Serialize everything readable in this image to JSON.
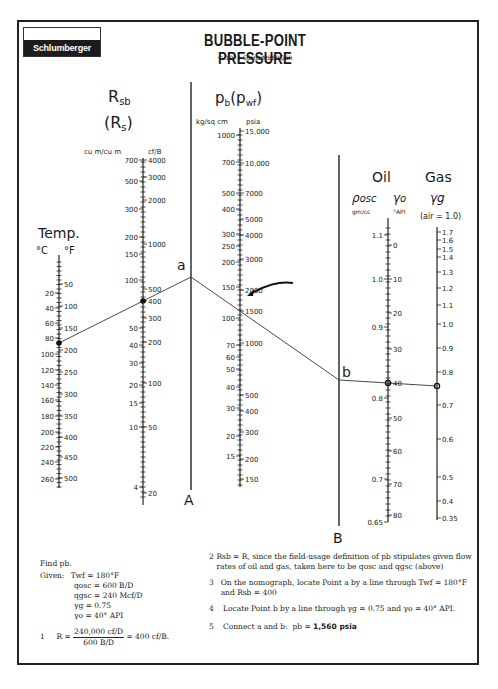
{
  "header": {
    "logo_text": "Schlumberger",
    "title": "BUBBLE-POINT PRESSURE",
    "copyright": "© 1974 SCHLUMBERGER"
  },
  "scales": {
    "temp": {
      "title": "Temp.",
      "unit_left": "°C",
      "unit_right": "°F",
      "left_ticks": [
        "20",
        "40",
        "60",
        "80",
        "100",
        "120",
        "140",
        "160",
        "180",
        "200",
        "220",
        "240",
        "260"
      ],
      "right_ticks": [
        "50",
        "100",
        "150",
        "200",
        "250",
        "300",
        "350",
        "400",
        "450",
        "500"
      ]
    },
    "rsb": {
      "title": "Rsb",
      "subtitle": "(Rs)",
      "unit_left": "cu m/cu m",
      "unit_right": "cf/B",
      "left_ticks": [
        "700",
        "500",
        "300",
        "200",
        "150",
        "100",
        "50",
        "40",
        "30",
        "20",
        "15",
        "10",
        "4"
      ],
      "right_ticks": [
        "4000",
        "3000",
        "2000",
        "1000",
        "500",
        "400",
        "300",
        "200",
        "100",
        "50",
        "20"
      ]
    },
    "pb": {
      "title": "pb(pwf)",
      "unit_left": "kg/sq cm",
      "unit_right": "psia",
      "left_ticks": [
        "1000",
        "700",
        "500",
        "400",
        "300",
        "250",
        "200",
        "150",
        "100",
        "70",
        "60",
        "50",
        "40",
        "30",
        "20",
        "15"
      ],
      "right_ticks": [
        "15,000",
        "10,000",
        "7000",
        "5000",
        "4000",
        "3000",
        "2000",
        "1500",
        "1000",
        "500",
        "400",
        "300",
        "200",
        "150"
      ]
    },
    "oil": {
      "title": "Oil",
      "rho_label": "ρosc",
      "gamma_label": "γo",
      "unit_left": "gm/cc",
      "unit_right": "°API",
      "left_ticks": [
        "1.1",
        "1.0",
        "0.9",
        "0.8",
        "0.7",
        "0.65"
      ],
      "right_ticks": [
        "0",
        "10",
        "20",
        "30",
        "40",
        "50",
        "60",
        "70",
        "80"
      ]
    },
    "gas": {
      "title": "Gas",
      "gamma_label": "γg",
      "unit": "(air = 1.0)",
      "ticks": [
        "1.7",
        "1.6",
        "1.5",
        "1.4",
        "1.3",
        "1.2",
        "1.1",
        "1.0",
        "0.9",
        "0.8",
        "0.7",
        "0.6",
        "0.5",
        "0.4",
        "0.35"
      ]
    },
    "turning_lines": {
      "a_label": "A",
      "b_label": "B"
    }
  },
  "points": {
    "a": "a",
    "b": "b"
  },
  "example": {
    "find": "Find pb.",
    "given_label": "Given:",
    "given": [
      "Twf = 180°F",
      "qosc = 600 B/D",
      "qgsc = 240 Mcf/D",
      "γg = 0.75",
      "γo = 40° API"
    ],
    "step1_num": "1",
    "step1_lhs": "R =",
    "step1_numerator": "240,000 cf/D",
    "step1_denominator": "600 B/D",
    "step1_rhs": "= 400 cf/B.",
    "steps": [
      {
        "num": "2",
        "text": "Rsb = R, since the field-usage definition of pb stipulates given flow rates of oil and gas, taken here to be qosc and qgsc (above)"
      },
      {
        "num": "3",
        "text": "On the nomograph, locate Point a by a line through Twf = 180°F and Rsb = 400"
      },
      {
        "num": "4",
        "text": "Locate Point b by a line through γg = 0.75 and γo = 40° API."
      },
      {
        "num": "5",
        "text_prefix": "Connect a and b:  pb = ",
        "result": "1,560 psia"
      }
    ]
  }
}
